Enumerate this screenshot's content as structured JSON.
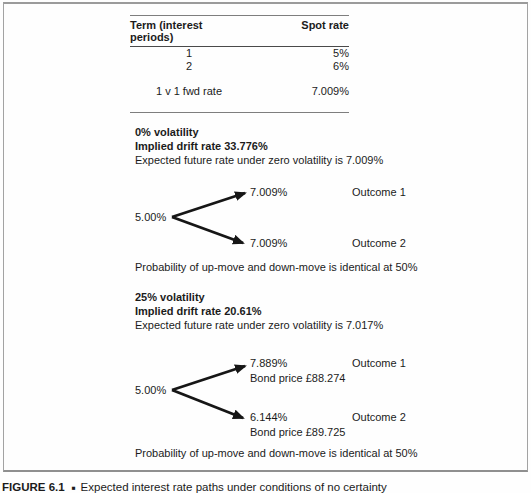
{
  "table": {
    "col1_header": "Term (interest periods)",
    "col2_header": "Spot rate",
    "rows": [
      {
        "term": "1",
        "rate": "5%"
      },
      {
        "term": "2",
        "rate": "6%"
      }
    ],
    "fwd_label": "1 v 1 fwd rate",
    "fwd_value": "7.009%"
  },
  "vol0": {
    "title": "0% volatility",
    "drift": "Implied drift rate 33.776%",
    "expected": "Expected future rate under zero volatility is 7.009%",
    "root_rate": "5.00%",
    "up_rate": "7.009%",
    "up_outcome": "Outcome 1",
    "down_rate": "7.009%",
    "down_outcome": "Outcome 2",
    "probability": "Probability of up-move and down-move is identical at 50%"
  },
  "vol25": {
    "title": "25% volatility",
    "drift": "Implied drift rate 20.61%",
    "expected": "Expected future rate under zero volatility is 7.017%",
    "root_rate": "5.00%",
    "up_rate": "7.889%",
    "up_bond_price": "Bond price £88.274",
    "up_outcome": "Outcome 1",
    "down_rate": "6.144%",
    "down_bond_price": "Bond price £89.725",
    "down_outcome": "Outcome 2",
    "probability": "Probability of up-move and down-move is identical at 50%"
  },
  "caption": {
    "label": "FIGURE 6.1",
    "separator": "■",
    "text": "Expected interest rate paths under conditions of no certainty"
  },
  "colors": {
    "text": "#1b1b1b",
    "arrow": "#161616",
    "rule_gray": "#7e7e7e",
    "box_border": "#a3a3a3"
  }
}
